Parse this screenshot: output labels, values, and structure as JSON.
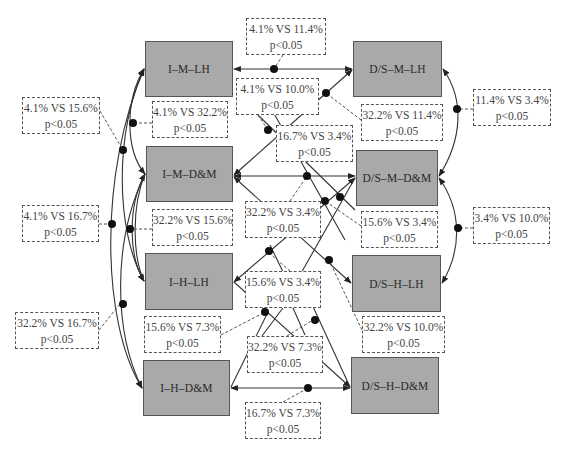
{
  "diagram": {
    "nodes": [
      {
        "id": "imlh",
        "label": "I–M–LH",
        "x": 145,
        "y": 41,
        "w": 88,
        "h": 56
      },
      {
        "id": "dsmlh",
        "label": "D/S–M–LH",
        "x": 353,
        "y": 41,
        "w": 89,
        "h": 56
      },
      {
        "id": "imdm",
        "label": "I–M–D&M",
        "x": 146,
        "y": 146,
        "w": 87,
        "h": 56
      },
      {
        "id": "dsmdm",
        "label": "D/S–M–D&M",
        "x": 356,
        "y": 150,
        "w": 82,
        "h": 56
      },
      {
        "id": "ihlh",
        "label": "I–H–LH",
        "x": 145,
        "y": 253,
        "w": 88,
        "h": 57
      },
      {
        "id": "dshlh",
        "label": "D/S–H–LH",
        "x": 352,
        "y": 255,
        "w": 89,
        "h": 57
      },
      {
        "id": "ihdm",
        "label": "I–H–D&M",
        "x": 143,
        "y": 360,
        "w": 87,
        "h": 56
      },
      {
        "id": "dshdm",
        "label": "D/S–H–D&M",
        "x": 351,
        "y": 357,
        "w": 88,
        "h": 57
      }
    ],
    "comparisons": [
      {
        "id": "c1",
        "from": "imlh",
        "to": "dsmlh",
        "text": "4.1% VS 11.4%",
        "p": "p<0.05",
        "x": 246,
        "y": 18,
        "w": 80,
        "h": 37
      },
      {
        "id": "c2",
        "from": "imlh",
        "to": "dsmdm",
        "text": "4.1% VS 10.0%",
        "p": "p<0.05",
        "x": 236,
        "y": 78,
        "w": 83,
        "h": 37
      },
      {
        "id": "c3",
        "from": "imlh",
        "to": "imdm",
        "text": "4.1% VS 32.2%",
        "p": "p<0.05",
        "x": 152,
        "y": 101,
        "w": 76,
        "h": 37
      },
      {
        "id": "c4",
        "from": "imlh",
        "to": "ihlh",
        "text": "4.1% VS 15.6%",
        "p": "p<0.05",
        "x": 22,
        "y": 97,
        "w": 78,
        "h": 37
      },
      {
        "id": "c5",
        "from": "imlh",
        "to": "ihdm",
        "text": "4.1% VS 16.7%",
        "p": "p<0.05",
        "x": 22,
        "y": 205,
        "w": 77,
        "h": 37
      },
      {
        "id": "c6",
        "from": "dsmlh",
        "to": "imdm",
        "text": "32.2% VS 11.4%",
        "p": "p<0.05",
        "x": 361,
        "y": 104,
        "w": 82,
        "h": 37
      },
      {
        "id": "c7",
        "from": "dsmlh",
        "to": "dsmdm",
        "text": "11.4% VS 3.4%",
        "p": "p<0.05",
        "x": 473,
        "y": 89,
        "w": 78,
        "h": 37
      },
      {
        "id": "c8",
        "from": "dsmlh",
        "to": "ihdm",
        "text": "16.7% VS 3.4%",
        "p": "p<0.05",
        "x": 276,
        "y": 125,
        "w": 77,
        "h": 37
      },
      {
        "id": "c9",
        "from": "imdm",
        "to": "ihlh",
        "text": "32.2% VS 15.6%",
        "p": "p<0.05",
        "x": 152,
        "y": 209,
        "w": 81,
        "h": 37
      },
      {
        "id": "c10",
        "from": "imdm",
        "to": "dsmdm",
        "text": "32.2% VS 3.4%",
        "p": "p<0.05",
        "x": 245,
        "y": 201,
        "w": 76,
        "h": 37
      },
      {
        "id": "c11",
        "from": "ihlh",
        "to": "dsmdm",
        "text": "15.6% VS 3.4%",
        "p": "p<0.05",
        "x": 361,
        "y": 211,
        "w": 77,
        "h": 37
      },
      {
        "id": "c12",
        "from": "dsmdm",
        "to": "dshlh",
        "text": "3.4% VS 10.0%",
        "p": "p<0.05",
        "x": 473,
        "y": 207,
        "w": 77,
        "h": 37
      },
      {
        "id": "c13",
        "from": "ihlh",
        "to": "dsmdm",
        "text": "15.6% VS 3.4%",
        "p": "p<0.05",
        "x": 245,
        "y": 271,
        "w": 76,
        "h": 37
      },
      {
        "id": "c14",
        "from": "imdm",
        "to": "ihdm",
        "text": "32.2% VS 16.7%",
        "p": "p<0.05",
        "x": 15,
        "y": 312,
        "w": 84,
        "h": 37
      },
      {
        "id": "c15",
        "from": "ihlh",
        "to": "ihdm",
        "text": "15.6% VS 7.3%",
        "p": "p<0.05",
        "x": 144,
        "y": 316,
        "w": 77,
        "h": 37
      },
      {
        "id": "c16",
        "from": "imdm",
        "to": "dshlh",
        "text": "32.2% VS 10.0%",
        "p": "p<0.05",
        "x": 362,
        "y": 316,
        "w": 83,
        "h": 37
      },
      {
        "id": "c17",
        "from": "imdm",
        "to": "dshdm",
        "text": "32.2% VS 7.3%",
        "p": "p<0.05",
        "x": 247,
        "y": 336,
        "w": 76,
        "h": 37
      },
      {
        "id": "c18",
        "from": "ihdm",
        "to": "dshdm",
        "text": "16.7% VS 7.3%",
        "p": "p<0.05",
        "x": 245,
        "y": 402,
        "w": 76,
        "h": 37
      }
    ]
  },
  "colors": {
    "node_fill": "#a9a9a9",
    "node_border": "#555555",
    "line": "#333333",
    "dashed": "#555555"
  }
}
